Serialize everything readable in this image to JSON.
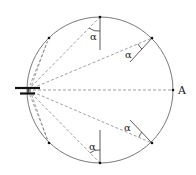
{
  "diagram": {
    "point_label": "A",
    "angle_label": "α",
    "colors": {
      "circle": "#555555",
      "dashed": "#777777",
      "solid_line": "#333333",
      "dot": "#111111",
      "source": "#111111"
    },
    "circle": {
      "cx": 100,
      "cy": 90,
      "r": 73
    },
    "source": {
      "x": 28,
      "y": 90
    },
    "points": [
      {
        "name": "top",
        "x": 100,
        "y": 17
      },
      {
        "name": "upper-right",
        "x": 152,
        "y": 38
      },
      {
        "name": "A",
        "x": 173,
        "y": 90
      },
      {
        "name": "lower-right",
        "x": 152,
        "y": 143
      },
      {
        "name": "bottom",
        "x": 100,
        "y": 163
      },
      {
        "name": "lower-left",
        "x": 49,
        "y": 143
      },
      {
        "name": "upper-left",
        "x": 49,
        "y": 38
      }
    ]
  }
}
